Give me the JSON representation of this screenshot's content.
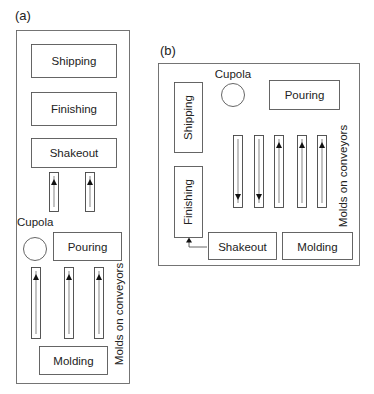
{
  "figure": {
    "layouts": [
      {
        "id": "a",
        "label": "(a)",
        "departments": {
          "shipping": "Shipping",
          "finishing": "Finishing",
          "shakeout": "Shakeout",
          "cupola": "Cupola",
          "pouring": "Pouring",
          "molding": "Molding"
        },
        "conveyor_note": "Molds on conveyors",
        "short_conveyors": [
          {
            "direction": "up"
          },
          {
            "direction": "up"
          }
        ],
        "mold_conveyors": [
          {
            "direction": "up"
          },
          {
            "direction": "up"
          },
          {
            "direction": "up"
          }
        ]
      },
      {
        "id": "b",
        "label": "(b)",
        "departments": {
          "shipping": "Shipping",
          "finishing": "Finishing",
          "shakeout": "Shakeout",
          "cupola": "Cupola",
          "pouring": "Pouring",
          "molding": "Molding"
        },
        "conveyor_note": "Molds on conveyors",
        "mold_conveyors": [
          {
            "direction": "down"
          },
          {
            "direction": "down"
          },
          {
            "direction": "up"
          },
          {
            "direction": "up"
          },
          {
            "direction": "up"
          }
        ],
        "flow_link": {
          "from": "Shakeout",
          "to": "Finishing"
        }
      }
    ]
  }
}
